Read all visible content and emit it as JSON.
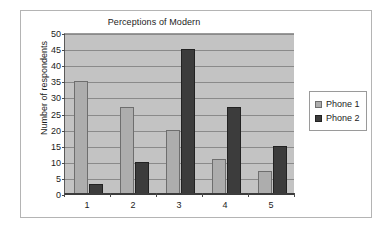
{
  "chart_data": {
    "type": "bar",
    "title": "Perceptions of Modern",
    "xlabel": "",
    "ylabel": "Number of respondents",
    "categories": [
      "1",
      "2",
      "3",
      "4",
      "5"
    ],
    "series": [
      {
        "name": "Phone 1",
        "color": "#adadad",
        "values": [
          35,
          27,
          20,
          11,
          7
        ]
      },
      {
        "name": "Phone 2",
        "color": "#3c3c3c",
        "values": [
          3,
          10,
          45,
          27,
          15
        ]
      }
    ],
    "ylim": [
      0,
      50
    ],
    "ytick_step": 5,
    "yticks": [
      0,
      5,
      10,
      15,
      20,
      25,
      30,
      35,
      40,
      45,
      50
    ],
    "grid": true,
    "legend_position": "right",
    "plot_background": "#c3c3c3",
    "page_background": "#ffffff"
  }
}
